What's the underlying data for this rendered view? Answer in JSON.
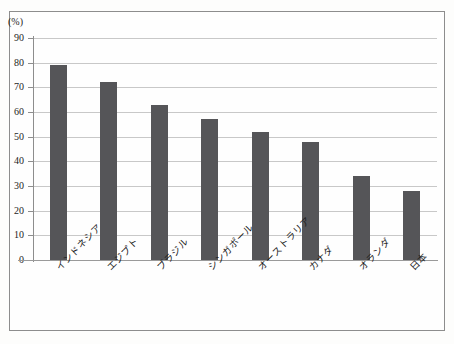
{
  "page": {
    "unit_label": "(%)",
    "title_remnant": "",
    "watermark": ""
  },
  "chart_data": {
    "type": "bar",
    "title": "",
    "xlabel": "",
    "ylabel": "(%)",
    "ylim": [
      0,
      90
    ],
    "ytick_step": 10,
    "yticks": [
      0,
      10,
      20,
      30,
      40,
      50,
      60,
      70,
      80,
      90
    ],
    "ytick_labels": [
      "0",
      "10",
      "20",
      "30",
      "40",
      "50",
      "60",
      "70",
      "80",
      "90"
    ],
    "grid": true,
    "legend": false,
    "bar_color": "#555558",
    "categories": [
      "インドネシア",
      "エジプト",
      "ブラジル",
      "シンガポール",
      "オーストラリア",
      "カナダ",
      "オランダ",
      "日本"
    ],
    "values": [
      79,
      72,
      63,
      57,
      52,
      48,
      34,
      28
    ]
  }
}
